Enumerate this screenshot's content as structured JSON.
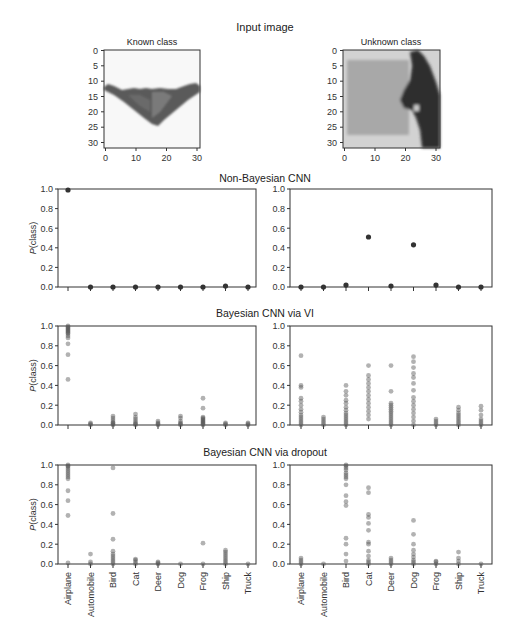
{
  "figure": {
    "main_title": "Input image",
    "input_images": [
      {
        "title": "Known class",
        "depicts": "airplane (stealth bomber silhouette)",
        "x_ticks": [
          "0",
          "10",
          "20",
          "30"
        ],
        "y_ticks": [
          "0",
          "5",
          "10",
          "15",
          "20",
          "25",
          "30"
        ]
      },
      {
        "title": "Unknown class",
        "depicts": "horse head",
        "x_ticks": [
          "0",
          "10",
          "20",
          "30"
        ],
        "y_ticks": [
          "0",
          "5",
          "10",
          "15",
          "20",
          "25",
          "30"
        ]
      }
    ],
    "row_titles": [
      "Non-Bayesian CNN",
      "Bayesian CNN via VI",
      "Bayesian CNN via dropout"
    ],
    "ylabel": "P(class)",
    "y_ticks": [
      "0.0",
      "0.2",
      "0.4",
      "0.6",
      "0.8",
      "1.0"
    ],
    "categories": [
      "Airplane",
      "Automobile",
      "Bird",
      "Cat",
      "Deer",
      "Dog",
      "Frog",
      "Ship",
      "Truck"
    ]
  },
  "chart_data": [
    {
      "type": "scatter",
      "title": "Non-Bayesian CNN — Known class",
      "xlabel": "",
      "ylabel": "P(class)",
      "ylim": [
        0,
        1
      ],
      "categories": [
        "Airplane",
        "Automobile",
        "Bird",
        "Cat",
        "Deer",
        "Dog",
        "Frog",
        "Ship",
        "Truck"
      ],
      "series": [
        {
          "name": "P(class)",
          "values": [
            [
              0.99
            ],
            [
              0.0
            ],
            [
              0.0
            ],
            [
              0.0
            ],
            [
              0.0
            ],
            [
              0.0
            ],
            [
              0.0
            ],
            [
              0.01
            ],
            [
              0.0
            ]
          ]
        }
      ]
    },
    {
      "type": "scatter",
      "title": "Non-Bayesian CNN — Unknown class",
      "xlabel": "",
      "ylabel": "P(class)",
      "ylim": [
        0,
        1
      ],
      "categories": [
        "Airplane",
        "Automobile",
        "Bird",
        "Cat",
        "Deer",
        "Dog",
        "Frog",
        "Ship",
        "Truck"
      ],
      "series": [
        {
          "name": "P(class)",
          "values": [
            [
              0.0
            ],
            [
              0.0
            ],
            [
              0.02
            ],
            [
              0.51
            ],
            [
              0.01
            ],
            [
              0.43
            ],
            [
              0.02
            ],
            [
              0.0
            ],
            [
              0.0
            ]
          ]
        }
      ]
    },
    {
      "type": "scatter",
      "title": "Bayesian CNN via VI — Known class",
      "xlabel": "",
      "ylabel": "P(class)",
      "ylim": [
        0,
        1
      ],
      "categories": [
        "Airplane",
        "Automobile",
        "Bird",
        "Cat",
        "Deer",
        "Dog",
        "Frog",
        "Ship",
        "Truck"
      ],
      "series": [
        {
          "name": "P(class) samples",
          "values": [
            [
              1.0,
              0.99,
              0.98,
              0.97,
              0.96,
              0.95,
              0.94,
              0.93,
              0.92,
              0.9,
              0.88,
              0.82,
              0.71,
              0.46
            ],
            [
              0.0,
              0.01,
              0.02
            ],
            [
              0.0,
              0.01,
              0.02,
              0.03,
              0.05,
              0.07,
              0.09
            ],
            [
              0.0,
              0.01,
              0.02,
              0.04,
              0.06,
              0.08,
              0.11
            ],
            [
              0.0,
              0.01,
              0.02,
              0.04
            ],
            [
              0.0,
              0.01,
              0.02,
              0.04,
              0.07,
              0.09
            ],
            [
              0.0,
              0.01,
              0.02,
              0.03,
              0.04,
              0.05,
              0.06,
              0.07,
              0.08,
              0.17,
              0.27
            ],
            [
              0.0,
              0.01,
              0.02
            ],
            [
              0.0,
              0.01,
              0.02
            ]
          ]
        }
      ]
    },
    {
      "type": "scatter",
      "title": "Bayesian CNN via VI — Unknown class",
      "xlabel": "",
      "ylabel": "P(class)",
      "ylim": [
        0,
        1
      ],
      "categories": [
        "Airplane",
        "Automobile",
        "Bird",
        "Cat",
        "Deer",
        "Dog",
        "Frog",
        "Ship",
        "Truck"
      ],
      "series": [
        {
          "name": "P(class) samples",
          "values": [
            [
              0.0,
              0.02,
              0.04,
              0.06,
              0.08,
              0.1,
              0.13,
              0.16,
              0.2,
              0.24,
              0.27,
              0.38,
              0.4,
              0.7
            ],
            [
              0.0,
              0.02,
              0.04,
              0.06,
              0.08
            ],
            [
              0.0,
              0.02,
              0.04,
              0.06,
              0.08,
              0.1,
              0.12,
              0.15,
              0.18,
              0.22,
              0.25,
              0.3,
              0.34,
              0.4
            ],
            [
              0.06,
              0.1,
              0.14,
              0.18,
              0.22,
              0.26,
              0.3,
              0.34,
              0.38,
              0.42,
              0.46,
              0.5,
              0.6
            ],
            [
              0.0,
              0.02,
              0.04,
              0.06,
              0.08,
              0.1,
              0.12,
              0.14,
              0.16,
              0.18,
              0.2,
              0.22,
              0.34,
              0.6
            ],
            [
              0.0,
              0.04,
              0.08,
              0.12,
              0.16,
              0.2,
              0.24,
              0.28,
              0.35,
              0.42,
              0.48,
              0.52,
              0.58,
              0.64,
              0.69
            ],
            [
              0.0,
              0.02,
              0.04,
              0.06
            ],
            [
              0.0,
              0.02,
              0.04,
              0.06,
              0.08,
              0.1,
              0.12,
              0.15,
              0.18
            ],
            [
              0.0,
              0.02,
              0.04,
              0.06,
              0.1,
              0.15,
              0.19
            ]
          ]
        }
      ]
    },
    {
      "type": "scatter",
      "title": "Bayesian CNN via dropout — Known class",
      "xlabel": "",
      "ylabel": "P(class)",
      "ylim": [
        0,
        1
      ],
      "categories": [
        "Airplane",
        "Automobile",
        "Bird",
        "Cat",
        "Deer",
        "Dog",
        "Frog",
        "Ship",
        "Truck"
      ],
      "series": [
        {
          "name": "P(class) samples",
          "values": [
            [
              1.0,
              0.99,
              0.98,
              0.96,
              0.94,
              0.92,
              0.9,
              0.88,
              0.86,
              0.74,
              0.64,
              0.49,
              0.01
            ],
            [
              0.0,
              0.02,
              0.1
            ],
            [
              0.0,
              0.02,
              0.04,
              0.06,
              0.08,
              0.1,
              0.13,
              0.25,
              0.51,
              0.97
            ],
            [
              0.0,
              0.02,
              0.04,
              0.05
            ],
            [
              0.0,
              0.01,
              0.02
            ],
            [
              0.0
            ],
            [
              0.0,
              0.21
            ],
            [
              0.0,
              0.02,
              0.04,
              0.06,
              0.08,
              0.1,
              0.12,
              0.14
            ],
            [
              0.0
            ]
          ]
        }
      ]
    },
    {
      "type": "scatter",
      "title": "Bayesian CNN via dropout — Unknown class",
      "xlabel": "",
      "ylabel": "P(class)",
      "ylim": [
        0,
        1
      ],
      "categories": [
        "Airplane",
        "Automobile",
        "Bird",
        "Cat",
        "Deer",
        "Dog",
        "Frog",
        "Ship",
        "Truck"
      ],
      "series": [
        {
          "name": "P(class) samples",
          "values": [
            [
              0.0,
              0.02,
              0.04,
              0.06
            ],
            [
              0.0
            ],
            [
              0.03,
              0.1,
              0.2,
              0.26,
              0.59,
              0.63,
              0.69,
              0.8,
              0.86,
              0.88,
              0.9,
              0.92,
              0.95,
              0.97,
              0.99,
              1.0
            ],
            [
              0.0,
              0.02,
              0.04,
              0.08,
              0.13,
              0.2,
              0.22,
              0.34,
              0.41,
              0.47,
              0.5,
              0.72,
              0.77
            ],
            [
              0.0,
              0.02,
              0.04,
              0.06
            ],
            [
              0.0,
              0.02,
              0.04,
              0.07,
              0.1,
              0.14,
              0.2,
              0.3,
              0.44
            ],
            [
              0.0,
              0.02,
              0.03
            ],
            [
              0.0,
              0.03,
              0.06,
              0.12
            ],
            [
              0.0
            ]
          ]
        }
      ]
    }
  ]
}
